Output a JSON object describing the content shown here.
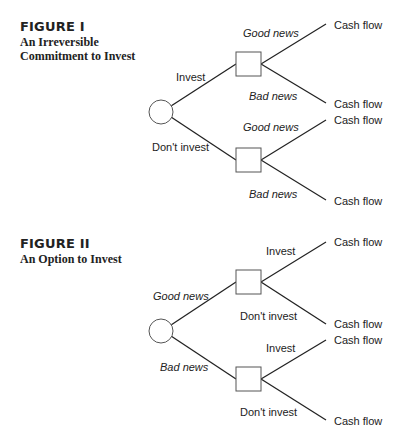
{
  "figure1": {
    "title": "FIGURE I",
    "subtitle_line1": "An Irreversible",
    "subtitle_line2": "Commitment to Invest",
    "root_branches": [
      "Invest",
      "Don't invest"
    ],
    "sub_branches": {
      "invest": [
        "Good news",
        "Bad news"
      ],
      "dont_invest": [
        "Good news",
        "Bad news"
      ]
    },
    "leaves": [
      "Cash flow",
      "Cash flow",
      "Cash flow",
      "Cash flow"
    ]
  },
  "figure2": {
    "title": "FIGURE II",
    "subtitle_line1": "An Option to Invest",
    "root_branches": [
      "Good news",
      "Bad news"
    ],
    "sub_branches": {
      "good_news": [
        "Invest",
        "Don't invest"
      ],
      "bad_news": [
        "Invest",
        "Don't invest"
      ]
    },
    "leaves": [
      "Cash flow",
      "Cash flow",
      "Cash flow",
      "Cash flow"
    ]
  }
}
